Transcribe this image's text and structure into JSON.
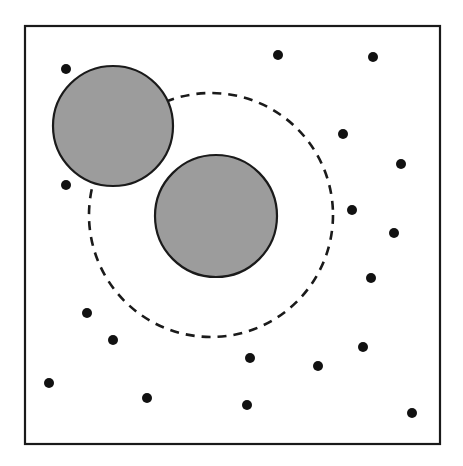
{
  "figure": {
    "width": 463,
    "height": 466,
    "background_color": "#ffffff"
  },
  "chart_data": {
    "type": "scatter",
    "title": "",
    "subtitle": "",
    "xlabel": "",
    "ylabel": "",
    "xlim": [
      0,
      463
    ],
    "ylim": [
      0,
      466
    ],
    "grid": false,
    "legend": null,
    "annotations": [],
    "axis_ticks": {
      "x": [],
      "y": []
    },
    "frame": {
      "name": "outer-square-boundary",
      "x": 25,
      "y": 26,
      "width": 415,
      "height": 418,
      "stroke": "#1a1a1a",
      "stroke_width": 2.2,
      "fill": "none"
    },
    "shaded_disks": [
      {
        "name": "upper-left-disk",
        "cx": 113,
        "cy": 126,
        "r": 60,
        "fill": "#9c9c9c",
        "stroke": "#1a1a1a",
        "stroke_width": 2.2
      },
      {
        "name": "lower-right-disk",
        "cx": 216,
        "cy": 216,
        "r": 61,
        "fill": "#9c9c9c",
        "stroke": "#1a1a1a",
        "stroke_width": 2.2
      }
    ],
    "dashed_circle": {
      "name": "dashed-interaction-boundary",
      "cx": 211,
      "cy": 215,
      "r": 122,
      "fill": "none",
      "stroke": "#1a1a1a",
      "stroke_width": 2.6,
      "dash_length": 9,
      "gap_length": 7
    },
    "points": {
      "name": "scattered-particles",
      "marker": "filled-circle",
      "color": "#111111",
      "radius": 5.0,
      "count": 22,
      "values": [
        [
          66,
          69
        ],
        [
          278,
          55
        ],
        [
          373,
          57
        ],
        [
          343,
          134
        ],
        [
          401,
          164
        ],
        [
          66,
          185
        ],
        [
          352,
          210
        ],
        [
          394,
          233
        ],
        [
          371,
          278
        ],
        [
          87,
          313
        ],
        [
          113,
          340
        ],
        [
          363,
          347
        ],
        [
          250,
          358
        ],
        [
          318,
          366
        ],
        [
          49,
          383
        ],
        [
          147,
          398
        ],
        [
          247,
          405
        ],
        [
          412,
          413
        ]
      ]
    }
  }
}
